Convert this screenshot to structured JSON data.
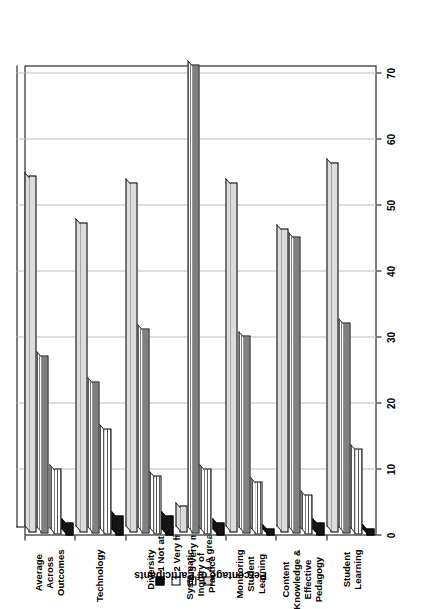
{
  "chart_data": {
    "type": "bar",
    "orientation": "horizontal",
    "title": "",
    "xlabel": "",
    "ylabel": "Percentage of Participants",
    "ylim": [
      0,
      70
    ],
    "yticks": [
      0,
      10,
      20,
      30,
      40,
      50,
      60,
      70
    ],
    "grid": true,
    "legend_position": "right",
    "categories": [
      "Student Learning",
      "Content Knowledge & Effective Pedagogy",
      "Monitoring Student Learning",
      "Systematic Inquiry of Practice",
      "Diversity",
      "Technology",
      "Average Across Outcomes"
    ],
    "category_lines": [
      [
        "Student",
        "Learning"
      ],
      [
        "Content",
        "Knowledge &",
        "Effective",
        "Pedagogy"
      ],
      [
        "Monitoring",
        "Student",
        "Learning"
      ],
      [
        "Systematic",
        "Inquiry of",
        "Practice"
      ],
      [
        "Diversity"
      ],
      [
        "Technology"
      ],
      [
        "Average",
        "Across",
        "Outcomes"
      ]
    ],
    "series": [
      {
        "name": "1  Not at all",
        "key": "1",
        "label": "Not at all",
        "values": [
          1,
          2,
          1,
          2,
          3,
          3,
          2
        ]
      },
      {
        "name": "2  Very little",
        "key": "2",
        "label": "Very little",
        "values": [
          13,
          6,
          8,
          10,
          9,
          16,
          10
        ]
      },
      {
        "name": "3  Very much",
        "key": "3",
        "label": "Very much",
        "values": [
          32,
          45,
          30,
          71,
          31,
          23,
          27
        ]
      },
      {
        "name": "4  A great deal",
        "key": "4",
        "label": "A great deal",
        "values": [
          56,
          46,
          53,
          4,
          53,
          47,
          54
        ]
      }
    ]
  },
  "legend": {
    "items": [
      {
        "num": "1",
        "label": "Not at all"
      },
      {
        "num": "2",
        "label": "Very little"
      },
      {
        "num": "3",
        "label": "Very much"
      },
      {
        "num": "4",
        "label": "A great deal"
      }
    ]
  },
  "axis": {
    "y_title": "Percentage of Participants",
    "ticks": [
      "0",
      "10",
      "20",
      "30",
      "40",
      "50",
      "60",
      "70"
    ]
  }
}
